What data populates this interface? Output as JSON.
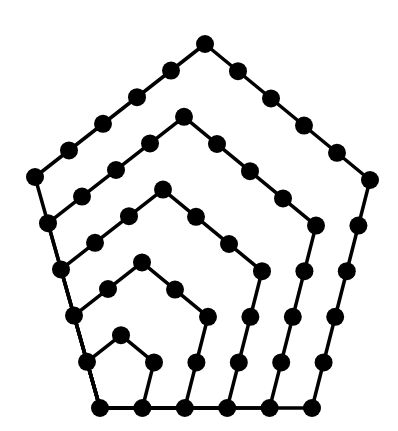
{
  "diagram": {
    "type": "nested-pentagon-dot-diagram",
    "colors": {
      "background": "#ffffff",
      "line": "#000000",
      "dot": "#000000"
    },
    "anchor": [
      100,
      408
    ],
    "outer_vertices": [
      [
        100,
        408
      ],
      [
        312,
        408
      ],
      [
        370,
        180
      ],
      [
        205,
        44
      ],
      [
        35,
        177
      ]
    ],
    "pentagon_orders": [
      2,
      3,
      4,
      5,
      6
    ],
    "max_order": 6,
    "dot_radius": 9,
    "line_width": 3.5
  },
  "chart_data": {
    "type": "diagram",
    "series": [
      {
        "name": "pentagon n=1",
        "dots": 1
      },
      {
        "name": "pentagon n=2",
        "dots": 5
      },
      {
        "name": "pentagon n=3",
        "dots": 12
      },
      {
        "name": "pentagon n=4",
        "dots": 22
      },
      {
        "name": "pentagon n=5",
        "dots": 35
      },
      {
        "name": "pentagon n=6",
        "dots": 51
      }
    ]
  }
}
